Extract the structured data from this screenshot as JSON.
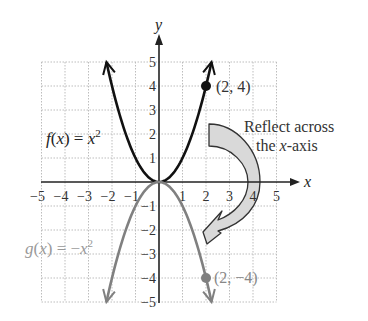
{
  "chart_data": {
    "type": "line",
    "title": "",
    "xlabel": "x",
    "ylabel": "y",
    "xlim": [
      -5,
      5
    ],
    "ylim": [
      -5,
      5
    ],
    "grid": true,
    "x_ticks": [
      "−5",
      "−4",
      "−3",
      "−2",
      "−1",
      "1",
      "2",
      "3",
      "4",
      "5"
    ],
    "y_ticks": [
      "5",
      "4",
      "3",
      "2",
      "1",
      "−1",
      "−2",
      "−3",
      "−4",
      "−5"
    ],
    "series": [
      {
        "name": "f(x) = x²",
        "expression": "x^2",
        "color": "#111111",
        "domain": [
          -2.236,
          2.236
        ],
        "x": [
          -2,
          -1,
          0,
          1,
          2
        ],
        "values": [
          4,
          1,
          0,
          1,
          4
        ]
      },
      {
        "name": "g(x) = −x²",
        "expression": "-x^2",
        "color": "#808080",
        "domain": [
          -2.236,
          2.236
        ],
        "x": [
          -2,
          -1,
          0,
          1,
          2
        ],
        "values": [
          -4,
          -1,
          0,
          -1,
          -4
        ]
      }
    ],
    "points": [
      {
        "label": "(2, 4)",
        "x": 2,
        "y": 4,
        "color": "#111111"
      },
      {
        "label": "(2, −4)",
        "x": 2,
        "y": -4,
        "color": "#808080"
      }
    ],
    "annotations": [
      {
        "text_line1": "Reflect across",
        "text_line2_pre": "the ",
        "text_line2_var": "x",
        "text_line2_post": "-axis",
        "arrow": "curved, from above x-axis to below x-axis"
      }
    ]
  },
  "labels": {
    "f_label_f": "f",
    "f_label_open": "(",
    "f_label_x": "x",
    "f_label_rest": ") = ",
    "f_label_x2": "x",
    "f_label_exp": "2",
    "g_label_g": "g",
    "g_label_open": "(",
    "g_label_x": "x",
    "g_label_rest": ") = −",
    "g_label_x2": "x",
    "g_label_exp": "2",
    "point_f": "(2, 4)",
    "point_g": "(2, −4)",
    "reflect_line1": "Reflect across",
    "reflect_line2_pre": "the ",
    "reflect_line2_var": "x",
    "reflect_line2_post": "-axis",
    "x_axis": "x",
    "y_axis": "y"
  },
  "colors": {
    "f_curve": "#111111",
    "g_curve": "#808080",
    "grid": "#bdbdbd",
    "axis": "#222222",
    "arrow_fill": "#d9d9d9",
    "arrow_stroke": "#333333"
  }
}
